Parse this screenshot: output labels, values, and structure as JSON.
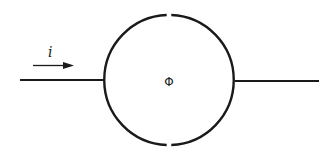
{
  "diagram": {
    "current_label": "i",
    "flux_label": "Φ",
    "current_direction": "left-to-right",
    "colors": {
      "stroke": "#1a1a1a",
      "background": "#ffffff"
    },
    "elements": [
      {
        "type": "wire",
        "name": "left-terminal"
      },
      {
        "type": "circle-with-gaps",
        "name": "element-body",
        "gaps": [
          "top",
          "bottom"
        ]
      },
      {
        "type": "wire",
        "name": "right-terminal"
      },
      {
        "type": "arrow",
        "name": "current-arrow",
        "label": "i"
      }
    ]
  }
}
